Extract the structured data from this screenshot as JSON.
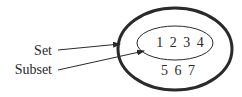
{
  "diagram": {
    "labels": {
      "set": "Set",
      "subset": "Subset"
    },
    "subset_elements": "1 2 3 4",
    "other_elements": "5 6 7",
    "colors": {
      "stroke": "#2a2a2a",
      "background": "#ffffff"
    }
  }
}
